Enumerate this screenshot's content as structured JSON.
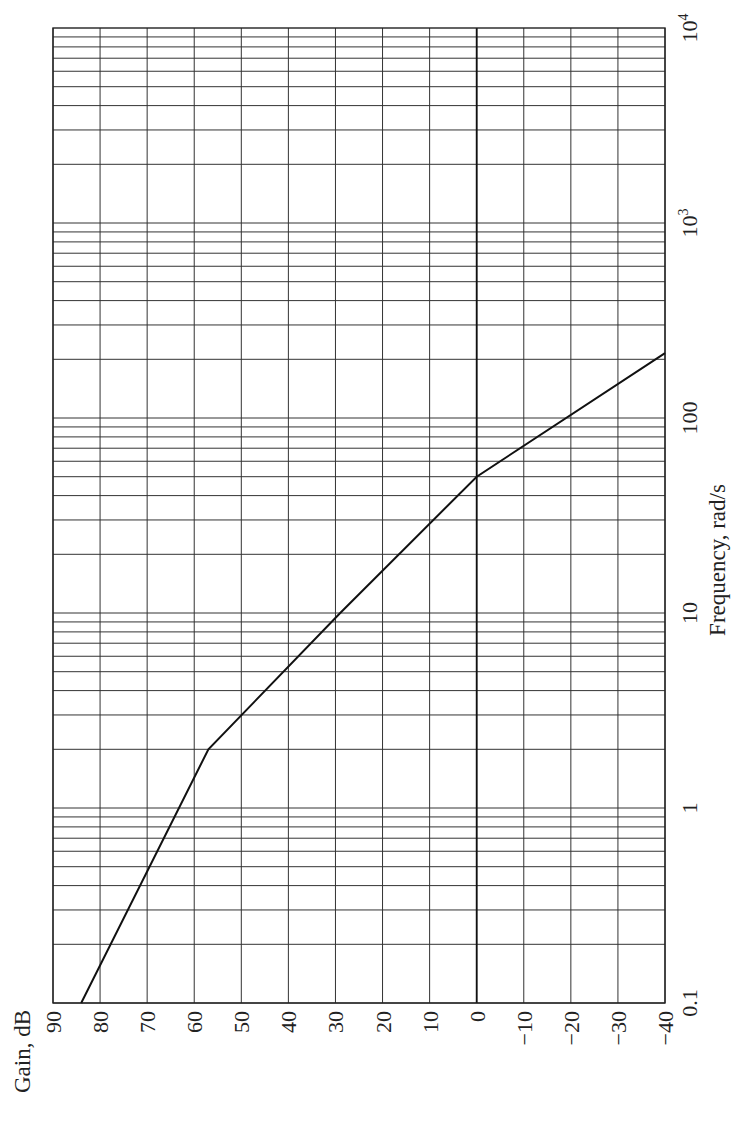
{
  "chart_data": {
    "type": "line",
    "title": "",
    "orientation": "rotated 90° counter-clockwise (gain axis runs left-to-right along bottom, frequency axis runs bottom-to-top along right side)",
    "xlabel": "Frequency, rad/s",
    "ylabel": "Gain, dB",
    "xscale": "log",
    "xlim": [
      0.1,
      10000
    ],
    "ylim": [
      -40,
      90
    ],
    "grid": true,
    "x_tick_labels": [
      "0.1",
      "1",
      "10",
      "100",
      "10³",
      "10⁴"
    ],
    "x_ticks": [
      0.1,
      1,
      10,
      100,
      1000,
      10000
    ],
    "y_tick_labels": [
      "90",
      "80",
      "70",
      "60",
      "50",
      "40",
      "30",
      "20",
      "10",
      "0",
      "−10",
      "−20",
      "−30",
      "−40"
    ],
    "y_ticks": [
      90,
      80,
      70,
      60,
      50,
      40,
      30,
      20,
      10,
      0,
      -10,
      -20,
      -30,
      -40
    ],
    "series": [
      {
        "name": "Asymptotic magnitude",
        "x": [
          0.1,
          2,
          10,
          50,
          215
        ],
        "y": [
          84,
          57,
          29,
          0,
          -40
        ]
      }
    ],
    "annotations": [
      "Slope −20 dB/decade from 0.1 to 2 rad/s",
      "Slope −40 dB/decade from 2 to 50 rad/s",
      "Slope −60 dB/decade above 50 rad/s",
      "0 dB line emphasized"
    ]
  },
  "labels": {
    "gain_axis_title": "Gain, dB",
    "freq_axis_title": "Frequency, rad/s",
    "gain_ticks": [
      "90",
      "80",
      "70",
      "60",
      "50",
      "40",
      "30",
      "20",
      "10",
      "0",
      "−10",
      "−20",
      "−30",
      "−40"
    ],
    "freq_ticks": [
      {
        "label": "0.1",
        "sup": ""
      },
      {
        "label": "1",
        "sup": ""
      },
      {
        "label": "10",
        "sup": ""
      },
      {
        "label": "100",
        "sup": ""
      },
      {
        "label": "10",
        "sup": "3"
      },
      {
        "label": "10",
        "sup": "4"
      }
    ]
  }
}
